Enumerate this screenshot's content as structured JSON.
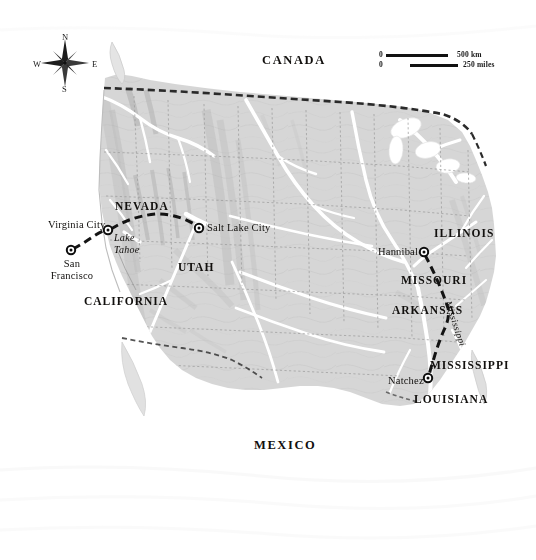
{
  "map": {
    "title": "Mark Twain's Western Journey Route Map",
    "region": "United States",
    "colors": {
      "land": "#d4d4d4",
      "land_light": "#dedede",
      "water": "#ffffff",
      "route": "#141414",
      "border": "#2b2b2b",
      "river": "#ffffff",
      "state_line": "#9a9a9a",
      "text": "#12100e"
    }
  },
  "countries": [
    {
      "name": "CANADA",
      "x": 262,
      "y": 60
    },
    {
      "name": "MEXICO",
      "x": 254,
      "y": 445
    }
  ],
  "states": [
    {
      "name": "NEVADA",
      "x": 115,
      "y": 206
    },
    {
      "name": "UTAH",
      "x": 178,
      "y": 267
    },
    {
      "name": "CALIFORNIA",
      "x": 84,
      "y": 301
    },
    {
      "name": "ILLINOIS",
      "x": 434,
      "y": 233
    },
    {
      "name": "MISSOURI",
      "x": 405,
      "y": 280
    },
    {
      "name": "ARKANSAS",
      "x": 396,
      "y": 310
    },
    {
      "name": "MISSISSIPPI",
      "x": 434,
      "y": 365
    },
    {
      "name": "LOUISIANA",
      "x": 418,
      "y": 399
    }
  ],
  "cities": [
    {
      "name": "San Francisco",
      "lines": [
        "San",
        "Francisco"
      ],
      "marker_x": 71,
      "marker_y": 250,
      "label_x": 71,
      "label_y": 258,
      "anchor": "below"
    },
    {
      "name": "Virginia City",
      "lines": [
        "Virginia City"
      ],
      "marker_x": 108,
      "marker_y": 230,
      "label_x": 105,
      "label_y": 220,
      "anchor": "left"
    },
    {
      "name": "Salt Lake City",
      "lines": [
        "Salt Lake City"
      ],
      "marker_x": 199,
      "marker_y": 228,
      "label_x": 207,
      "label_y": 222,
      "anchor": "right"
    },
    {
      "name": "Hannibal",
      "lines": [
        "Hannibal"
      ],
      "marker_x": 424,
      "marker_y": 252,
      "label_x": 420,
      "label_y": 246,
      "anchor": "left"
    },
    {
      "name": "Natchez",
      "lines": [
        "Natchez"
      ],
      "marker_x": 428,
      "marker_y": 378,
      "label_x": 424,
      "label_y": 374,
      "anchor": "left"
    }
  ],
  "water_features": [
    {
      "name": "Lake Tahoe",
      "lines": [
        "Lake",
        "Tahoe"
      ],
      "x": 117,
      "y": 235
    }
  ],
  "rivers": [
    {
      "name": "Mississippi",
      "x": 452,
      "y": 300,
      "rotation": 72
    }
  ],
  "compass": {
    "center_x": 65,
    "center_y": 63,
    "north": "N",
    "south": "S",
    "east": "E",
    "west": "W"
  },
  "scale": {
    "zero_label": "0",
    "km_label": "500 km",
    "miles_label": "250 miles",
    "km_bar_x": 386,
    "km_bar_y": 55,
    "km_bar_width": 62,
    "miles_bar_x": 410,
    "miles_bar_y": 65,
    "miles_bar_width": 48
  },
  "route": {
    "label": "Journey route",
    "style": "dashed",
    "segments": [
      {
        "from": "San Francisco",
        "to": "Virginia City"
      },
      {
        "from": "Virginia City",
        "to": "Salt Lake City"
      },
      {
        "from": "Hannibal",
        "to": "Natchez"
      }
    ]
  }
}
